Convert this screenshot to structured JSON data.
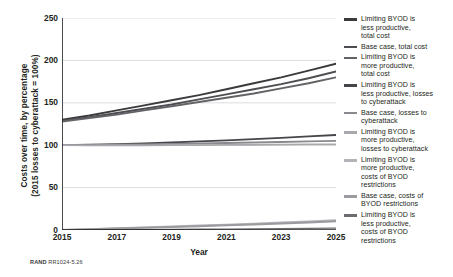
{
  "figure": {
    "footer_brand": "RAND",
    "footer_code": "RR1024-5.26"
  },
  "chart_data": {
    "type": "line",
    "title": "",
    "xlabel": "Year",
    "ylabel_line1": "Costs over time, by percentage",
    "ylabel_line2": "(2015 losses to cyberattack = 100%)",
    "x": [
      2015,
      2016,
      2017,
      2018,
      2019,
      2020,
      2021,
      2022,
      2023,
      2024,
      2025
    ],
    "xlim": [
      2015,
      2025
    ],
    "ylim": [
      0,
      250
    ],
    "xticks": [
      2015,
      2017,
      2019,
      2021,
      2023,
      2025
    ],
    "yticks": [
      0,
      50,
      100,
      150,
      200,
      250
    ],
    "grid": "horizontal",
    "legend_position": "right",
    "series": [
      {
        "name": "Limiting BYOD is less productive, total cost",
        "label_lines": [
          "Limiting BYOD is",
          "less productive,",
          "total cost"
        ],
        "color": "#3a3a3c",
        "width": 1.9,
        "values": [
          130,
          135,
          141,
          147,
          153,
          159,
          166,
          173,
          180,
          188,
          196
        ]
      },
      {
        "name": "Base case, total cost",
        "label_lines": [
          "Base case, total cost"
        ],
        "color": "#4e4e52",
        "width": 1.9,
        "values": [
          129,
          133,
          138,
          143,
          148,
          154,
          160,
          166,
          172,
          179,
          187
        ]
      },
      {
        "name": "Limiting BYOD is more productive, total cost",
        "label_lines": [
          "Limiting BYOD is",
          "more productive,",
          "total cost"
        ],
        "color": "#636367",
        "width": 1.9,
        "values": [
          128,
          132,
          136,
          141,
          146,
          151,
          156,
          161,
          167,
          173,
          180
        ]
      },
      {
        "name": "Limiting BYOD is less productive, losses to cyberattack",
        "label_lines": [
          "Limiting BYOD is",
          "less productive, losses",
          "to cyberattack"
        ],
        "color": "#46464a",
        "width": 1.8,
        "values": [
          100,
          100.6,
          101.3,
          102.2,
          103.2,
          104.4,
          105.8,
          107.2,
          108.7,
          110.3,
          112
        ]
      },
      {
        "name": "Base case, losses to cyberattack",
        "label_lines": [
          "Base case, losses to",
          "cyberattack"
        ],
        "color": "#8a8a8e",
        "width": 1.8,
        "values": [
          100,
          100.2,
          100.6,
          101.0,
          101.5,
          102.0,
          102.6,
          103.2,
          103.8,
          104.4,
          105
        ]
      },
      {
        "name": "Limiting BYOD is more productive, losses to cyberattack",
        "label_lines": [
          "Limiting BYOD is",
          "more productive,",
          "losses to cyberattack"
        ],
        "color": "#a9a9ad",
        "width": 1.8,
        "values": [
          100,
          99.9,
          99.9,
          99.9,
          100.0,
          100.1,
          100.3,
          100.5,
          100.7,
          100.9,
          101
        ]
      },
      {
        "name": "Limiting BYOD is more productive, costs of BYOD restrictions",
        "label_lines": [
          "Limiting BYOD is",
          "more productive,",
          "costs of BYOD",
          "restrictions"
        ],
        "color": "#b4b4b8",
        "width": 2.0,
        "values": [
          0,
          1.0,
          2.0,
          3.0,
          4.1,
          5.2,
          6.3,
          7.5,
          8.7,
          10.0,
          11.6
        ]
      },
      {
        "name": "Base case, costs of BYOD restrictions",
        "label_lines": [
          "Base case, costs of",
          "BYOD restrictions"
        ],
        "color": "#9b9b9f",
        "width": 2.0,
        "values": [
          0,
          0.8,
          1.7,
          2.6,
          3.5,
          4.5,
          5.5,
          6.6,
          7.7,
          8.9,
          10.2
        ]
      },
      {
        "name": "Limiting BYOD is less productive, costs of BYOD restrictions",
        "label_lines": [
          "Limiting BYOD is",
          "less productive,",
          "costs of BYOD",
          "restrictions"
        ],
        "color": "#6d6d71",
        "width": 1.2,
        "values": [
          0,
          0.2,
          0.4,
          0.6,
          0.8,
          1.0,
          1.2,
          1.4,
          1.6,
          1.8,
          2.1
        ]
      }
    ]
  }
}
